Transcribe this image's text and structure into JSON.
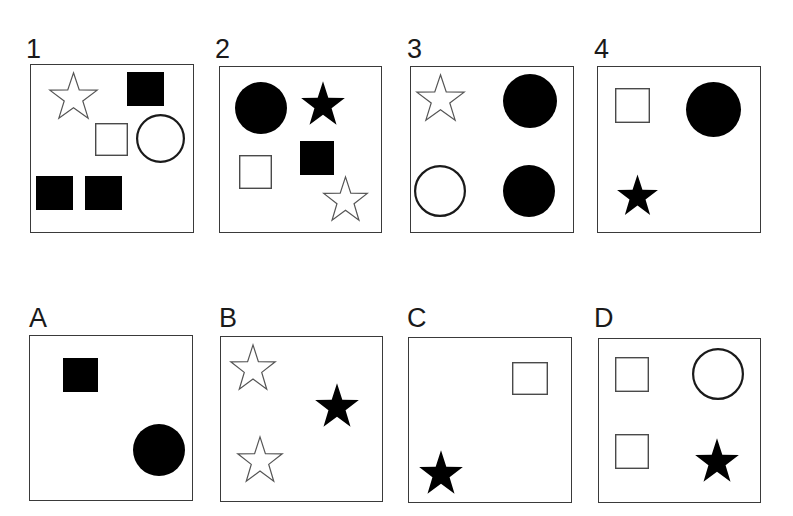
{
  "figure": {
    "type": "visual-analogy-puzzle",
    "background_color": "#ffffff",
    "ink_color": "#000000",
    "box_border_color": "#3a3a3a",
    "canvas": {
      "width": 793,
      "height": 516
    }
  },
  "rows": [
    {
      "name": "stimulus-row",
      "panels": [
        {
          "label": "1",
          "label_pos": {
            "x": 26,
            "y": 36
          },
          "box": {
            "x": 30,
            "y": 64,
            "w": 164,
            "h": 169
          },
          "shapes": [
            {
              "name": "open-star",
              "kind": "star",
              "fill": "none",
              "x": 48,
              "y": 74,
              "w": 51,
              "h": 46
            },
            {
              "name": "filled-square",
              "kind": "square",
              "fill": "solid",
              "x": 127,
              "y": 72,
              "w": 37,
              "h": 34
            },
            {
              "name": "open-square",
              "kind": "square",
              "fill": "none",
              "x": 95,
              "y": 123,
              "w": 33,
              "h": 33
            },
            {
              "name": "open-circle",
              "kind": "circle",
              "fill": "none",
              "x": 136,
              "y": 114,
              "w": 49,
              "h": 49
            },
            {
              "name": "filled-square",
              "kind": "square",
              "fill": "solid",
              "x": 36,
              "y": 176,
              "w": 37,
              "h": 34
            },
            {
              "name": "filled-square",
              "kind": "square",
              "fill": "solid",
              "x": 85,
              "y": 176,
              "w": 37,
              "h": 34
            }
          ]
        },
        {
          "label": "2",
          "label_pos": {
            "x": 215,
            "y": 36
          },
          "box": {
            "x": 219,
            "y": 66,
            "w": 163,
            "h": 167
          },
          "shapes": [
            {
              "name": "filled-circle",
              "kind": "circle",
              "fill": "solid",
              "x": 235,
              "y": 82,
              "w": 52,
              "h": 52
            },
            {
              "name": "filled-star",
              "kind": "star",
              "fill": "solid",
              "x": 300,
              "y": 83,
              "w": 46,
              "h": 43
            },
            {
              "name": "filled-square",
              "kind": "square",
              "fill": "solid",
              "x": 300,
              "y": 141,
              "w": 34,
              "h": 34
            },
            {
              "name": "open-square",
              "kind": "square",
              "fill": "none",
              "x": 239,
              "y": 155,
              "w": 33,
              "h": 34
            },
            {
              "name": "open-star",
              "kind": "star",
              "fill": "none",
              "x": 322,
              "y": 178,
              "w": 47,
              "h": 44
            }
          ]
        },
        {
          "label": "3",
          "label_pos": {
            "x": 407,
            "y": 36
          },
          "box": {
            "x": 410,
            "y": 66,
            "w": 164,
            "h": 167
          },
          "shapes": [
            {
              "name": "open-star",
              "kind": "star",
              "fill": "none",
              "x": 415,
              "y": 76,
              "w": 51,
              "h": 46
            },
            {
              "name": "filled-circle",
              "kind": "circle",
              "fill": "solid",
              "x": 503,
              "y": 74,
              "w": 54,
              "h": 54
            },
            {
              "name": "open-circle",
              "kind": "circle",
              "fill": "none",
              "x": 414,
              "y": 165,
              "w": 52,
              "h": 52
            },
            {
              "name": "filled-circle",
              "kind": "circle",
              "fill": "solid",
              "x": 503,
              "y": 165,
              "w": 52,
              "h": 52
            }
          ]
        },
        {
          "label": "4",
          "label_pos": {
            "x": 594,
            "y": 36
          },
          "box": {
            "x": 597,
            "y": 66,
            "w": 164,
            "h": 167
          },
          "shapes": [
            {
              "name": "open-square",
              "kind": "square",
              "fill": "none",
              "x": 615,
              "y": 88,
              "w": 35,
              "h": 35
            },
            {
              "name": "filled-circle",
              "kind": "circle",
              "fill": "solid",
              "x": 686,
              "y": 82,
              "w": 55,
              "h": 55
            },
            {
              "name": "filled-star",
              "kind": "star",
              "fill": "solid",
              "x": 616,
              "y": 176,
              "w": 43,
              "h": 40
            }
          ]
        }
      ]
    },
    {
      "name": "answer-row",
      "panels": [
        {
          "label": "A",
          "label_pos": {
            "x": 29,
            "y": 305
          },
          "box": {
            "x": 29,
            "y": 335,
            "w": 164,
            "h": 166
          },
          "shapes": [
            {
              "name": "filled-square",
              "kind": "square",
              "fill": "solid",
              "x": 63,
              "y": 358,
              "w": 35,
              "h": 34
            },
            {
              "name": "filled-circle",
              "kind": "circle",
              "fill": "solid",
              "x": 133,
              "y": 424,
              "w": 52,
              "h": 52
            }
          ]
        },
        {
          "label": "B",
          "label_pos": {
            "x": 219,
            "y": 305
          },
          "box": {
            "x": 220,
            "y": 336,
            "w": 163,
            "h": 166
          },
          "shapes": [
            {
              "name": "open-star",
              "kind": "star",
              "fill": "none",
              "x": 229,
              "y": 346,
              "w": 48,
              "h": 45
            },
            {
              "name": "filled-star",
              "kind": "star",
              "fill": "solid",
              "x": 314,
              "y": 385,
              "w": 46,
              "h": 43
            },
            {
              "name": "open-star",
              "kind": "star",
              "fill": "none",
              "x": 236,
              "y": 438,
              "w": 48,
              "h": 45
            }
          ]
        },
        {
          "label": "C",
          "label_pos": {
            "x": 407,
            "y": 305
          },
          "box": {
            "x": 408,
            "y": 337,
            "w": 164,
            "h": 166
          },
          "shapes": [
            {
              "name": "open-square",
              "kind": "square",
              "fill": "none",
              "x": 512,
              "y": 362,
              "w": 36,
              "h": 33
            },
            {
              "name": "filled-star",
              "kind": "star",
              "fill": "solid",
              "x": 418,
              "y": 452,
              "w": 46,
              "h": 43
            }
          ]
        },
        {
          "label": "D",
          "label_pos": {
            "x": 594,
            "y": 305
          },
          "box": {
            "x": 598,
            "y": 338,
            "w": 163,
            "h": 165
          },
          "shapes": [
            {
              "name": "open-square",
              "kind": "square",
              "fill": "none",
              "x": 615,
              "y": 357,
              "w": 34,
              "h": 35
            },
            {
              "name": "open-circle",
              "kind": "circle",
              "fill": "none",
              "x": 692,
              "y": 348,
              "w": 52,
              "h": 52
            },
            {
              "name": "open-square",
              "kind": "square",
              "fill": "none",
              "x": 615,
              "y": 434,
              "w": 34,
              "h": 35
            },
            {
              "name": "filled-star",
              "kind": "star",
              "fill": "solid",
              "x": 694,
              "y": 440,
              "w": 46,
              "h": 43
            }
          ]
        }
      ]
    }
  ]
}
